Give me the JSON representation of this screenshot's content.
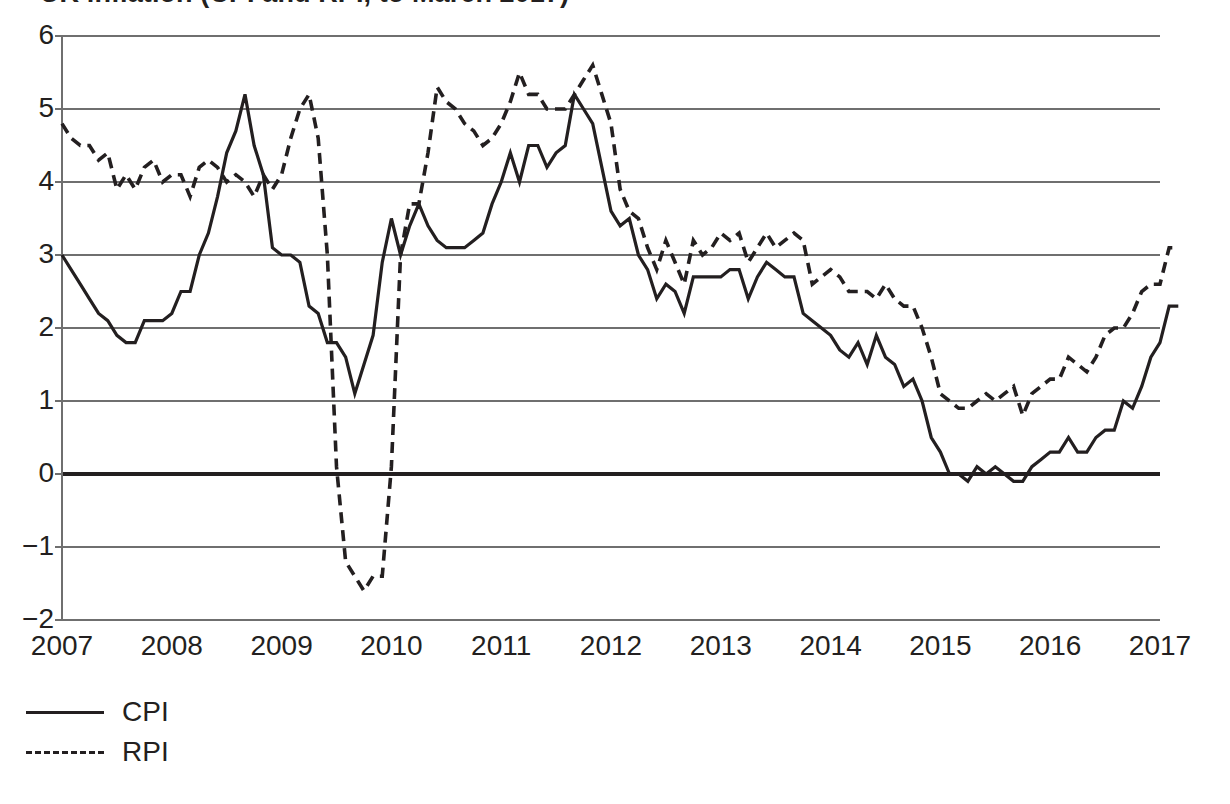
{
  "figure": {
    "title_partial": "UK inflation (CPI and RPI, to March 2017)",
    "title_note": "title-row-clipped-at-top-edge"
  },
  "axes": {
    "y_ticks": [
      "6",
      "5",
      "4",
      "3",
      "2",
      "1",
      "0",
      "-1",
      "-2"
    ],
    "x_ticks": [
      "2007",
      "2008",
      "2009",
      "2010",
      "2011",
      "2012",
      "2013",
      "2014",
      "2015",
      "2016",
      "2017"
    ]
  },
  "legend": {
    "items": [
      {
        "label": "CPI",
        "style": "solid"
      },
      {
        "label": "RPI",
        "style": "dashed"
      }
    ]
  },
  "colors": {
    "line": "#231f20",
    "grid": "#6f6f6f",
    "zero_line": "#231f20",
    "background": "#ffffff"
  },
  "chart_data": {
    "type": "line",
    "title": "UK inflation (CPI and RPI, to March 2017)",
    "xlabel": "",
    "ylabel": "",
    "ylim": [
      -2,
      6
    ],
    "xlim": [
      2007,
      2017
    ],
    "grid": true,
    "legend_position": "below-left",
    "y_ticks": [
      6,
      5,
      4,
      3,
      2,
      1,
      0,
      -1,
      -2
    ],
    "x_ticks": [
      2007,
      2008,
      2009,
      2010,
      2011,
      2012,
      2013,
      2014,
      2015,
      2016,
      2017
    ],
    "x_start": 2007.0,
    "x_step_months": 1,
    "series": [
      {
        "name": "CPI",
        "style": "solid",
        "values": [
          3.0,
          2.8,
          2.6,
          2.4,
          2.2,
          2.1,
          1.9,
          1.8,
          1.8,
          2.1,
          2.1,
          2.1,
          2.2,
          2.5,
          2.5,
          3.0,
          3.3,
          3.8,
          4.4,
          4.7,
          5.2,
          4.5,
          4.1,
          3.1,
          3.0,
          3.0,
          2.9,
          2.3,
          2.2,
          1.8,
          1.8,
          1.6,
          1.1,
          1.5,
          1.9,
          2.9,
          3.5,
          3.0,
          3.4,
          3.7,
          3.4,
          3.2,
          3.1,
          3.1,
          3.1,
          3.2,
          3.3,
          3.7,
          4.0,
          4.4,
          4.0,
          4.5,
          4.5,
          4.2,
          4.4,
          4.5,
          5.2,
          5.0,
          4.8,
          4.2,
          3.6,
          3.4,
          3.5,
          3.0,
          2.8,
          2.4,
          2.6,
          2.5,
          2.2,
          2.7,
          2.7,
          2.7,
          2.7,
          2.8,
          2.8,
          2.4,
          2.7,
          2.9,
          2.8,
          2.7,
          2.7,
          2.2,
          2.1,
          2.0,
          1.9,
          1.7,
          1.6,
          1.8,
          1.5,
          1.9,
          1.6,
          1.5,
          1.2,
          1.3,
          1.0,
          0.5,
          0.3,
          0.0,
          0.0,
          -0.1,
          0.1,
          0.0,
          0.1,
          0.0,
          -0.1,
          -0.1,
          0.1,
          0.2,
          0.3,
          0.3,
          0.5,
          0.3,
          0.3,
          0.5,
          0.6,
          0.6,
          1.0,
          0.9,
          1.2,
          1.6,
          1.8,
          2.3,
          2.3
        ]
      },
      {
        "name": "RPI",
        "style": "dashed",
        "values": [
          4.8,
          4.6,
          4.5,
          4.5,
          4.3,
          4.4,
          3.9,
          4.1,
          3.9,
          4.2,
          4.3,
          4.0,
          4.1,
          4.1,
          3.8,
          4.2,
          4.3,
          4.2,
          4.0,
          4.1,
          4.0,
          3.8,
          4.1,
          3.9,
          4.1,
          4.6,
          5.0,
          5.2,
          4.6,
          3.0,
          0.1,
          -1.2,
          -1.4,
          -1.6,
          -1.4,
          -1.4,
          0.1,
          3.0,
          3.7,
          3.7,
          4.4,
          5.3,
          5.1,
          5.0,
          4.8,
          4.7,
          4.5,
          4.6,
          4.8,
          5.1,
          5.5,
          5.2,
          5.2,
          5.0,
          5.0,
          5.0,
          5.2,
          5.4,
          5.6,
          5.2,
          4.8,
          3.9,
          3.6,
          3.5,
          3.1,
          2.8,
          3.2,
          2.9,
          2.6,
          3.2,
          3.0,
          3.1,
          3.3,
          3.2,
          3.3,
          2.9,
          3.1,
          3.3,
          3.1,
          3.2,
          3.3,
          3.2,
          2.6,
          2.7,
          2.8,
          2.7,
          2.5,
          2.5,
          2.5,
          2.4,
          2.6,
          2.4,
          2.3,
          2.3,
          2.0,
          1.6,
          1.1,
          1.0,
          0.9,
          0.9,
          1.0,
          1.1,
          1.0,
          1.1,
          1.2,
          0.8,
          1.1,
          1.2,
          1.3,
          1.3,
          1.6,
          1.5,
          1.4,
          1.6,
          1.9,
          2.0,
          2.0,
          2.2,
          2.5,
          2.6,
          2.6,
          3.1,
          3.1
        ]
      }
    ]
  },
  "geometry": {
    "plot_left": 62,
    "plot_right": 1160,
    "plot_top": 36,
    "plot_bottom": 620
  }
}
